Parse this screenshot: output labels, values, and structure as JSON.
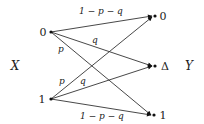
{
  "diagram": {
    "input_label": "X",
    "output_label": "Y",
    "inputs": [
      {
        "id": "in0",
        "label": "0"
      },
      {
        "id": "in1",
        "label": "1"
      }
    ],
    "outputs": [
      {
        "id": "out0",
        "label": "0"
      },
      {
        "id": "outD",
        "label": "Δ"
      },
      {
        "id": "out1",
        "label": "1"
      }
    ],
    "edges": [
      {
        "from": "in0",
        "to": "out0",
        "label": "1 − p − q"
      },
      {
        "from": "in0",
        "to": "outD",
        "label": "q"
      },
      {
        "from": "in0",
        "to": "out1",
        "label": "p"
      },
      {
        "from": "in1",
        "to": "out0",
        "label": "p"
      },
      {
        "from": "in1",
        "to": "outD",
        "label": "q"
      },
      {
        "from": "in1",
        "to": "out1",
        "label": "1 − p − q"
      }
    ]
  }
}
